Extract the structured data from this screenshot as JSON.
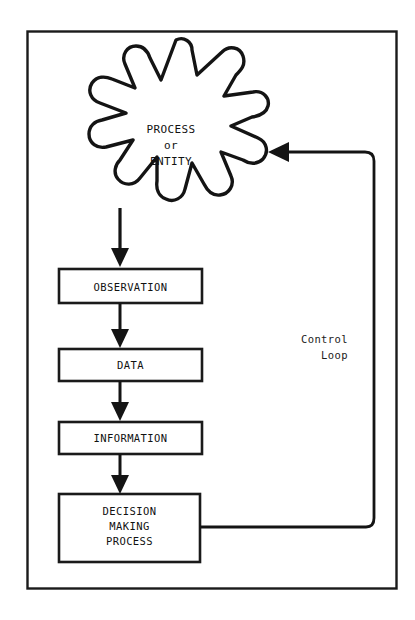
{
  "diagram": {
    "colors": {
      "ink": "#111111",
      "background": "#ffffff",
      "border": "#1a1a1a"
    },
    "burst": {
      "name": "process-or-entity",
      "lines": [
        "PROCESS",
        "or",
        "ENTITY"
      ],
      "text": "PROCESS\nor\nENTITY"
    },
    "boxes": [
      {
        "id": "observation",
        "label": "OBSERVATION"
      },
      {
        "id": "data",
        "label": "DATA"
      },
      {
        "id": "information",
        "label": "INFORMATION"
      },
      {
        "id": "decision",
        "label": "DECISION\nMAKING\nPROCESS",
        "lines": [
          "DECISION",
          "MAKING",
          "PROCESS"
        ]
      }
    ],
    "loop": {
      "id": "control-loop",
      "label": "Control\nLoop",
      "lines": [
        "Control",
        "Loop"
      ]
    },
    "flow_order": [
      "PROCESS or ENTITY",
      "OBSERVATION",
      "DATA",
      "INFORMATION",
      "DECISION MAKING PROCESS",
      "Control Loop back to PROCESS or ENTITY"
    ]
  }
}
